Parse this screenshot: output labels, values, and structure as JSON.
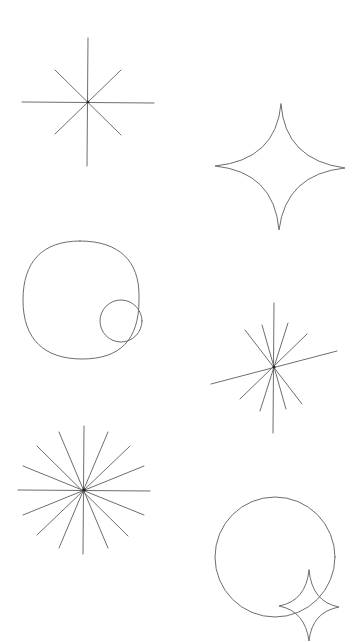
{
  "canvas": {
    "width": 361,
    "height": 642,
    "background": "#ffffff",
    "stroke_color": "#6e6e6e"
  },
  "shapes": [
    {
      "id": "starburst-8",
      "kind": "starburst",
      "center": [
        88,
        102
      ],
      "rays": 8
    },
    {
      "id": "four-point-star-large",
      "kind": "four-point-star",
      "top": [
        281,
        104
      ],
      "left": [
        215,
        166
      ],
      "right": [
        345,
        168
      ],
      "bottom": [
        279,
        230
      ]
    },
    {
      "id": "squircle-with-circle",
      "kind": "squircle-circle",
      "squircle_bounds": [
        23,
        241,
        140,
        359
      ],
      "circle_center": [
        121,
        321
      ],
      "circle_radius": 21
    },
    {
      "id": "starburst-irregular",
      "kind": "starburst",
      "center": [
        274,
        367
      ],
      "rays": 12
    },
    {
      "id": "starburst-16",
      "kind": "starburst",
      "center": [
        84,
        490
      ],
      "rays": 16
    },
    {
      "id": "circle-with-star",
      "kind": "circle-star",
      "circle_center": [
        275,
        557
      ],
      "circle_radius": 60,
      "star": {
        "top": [
          309,
          570
        ],
        "left": [
          279,
          606
        ],
        "right": [
          339,
          607
        ],
        "bottom": [
          309,
          641
        ]
      }
    }
  ]
}
